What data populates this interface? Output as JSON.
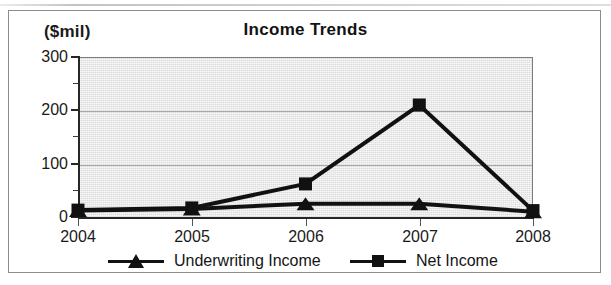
{
  "figure": {
    "unit_label": "($mil)",
    "title": "Income Trends"
  },
  "legend": {
    "entries": [
      {
        "label": "Underwriting Income",
        "marker": "triangle-marker",
        "color": "#111111"
      },
      {
        "label": "Net Income",
        "marker": "square-marker",
        "color": "#111111"
      }
    ]
  },
  "axes": {
    "y_ticks": [
      "0",
      "100",
      "200",
      "300"
    ],
    "x_ticks": [
      "2004",
      "2005",
      "2006",
      "2007",
      "2008"
    ]
  },
  "colors": {
    "plot_background": "#dcdcdc",
    "gridline": "#a8a8a8",
    "axis": "#262626",
    "series": "#111111",
    "frame": "#8d8d8d"
  },
  "chart_data": {
    "type": "line",
    "title": "Income Trends",
    "xlabel": "",
    "ylabel": "($mil)",
    "ylim": [
      0,
      300
    ],
    "yticks": [
      0,
      100,
      200,
      300
    ],
    "y_minor_ticks": [
      50,
      150,
      250
    ],
    "grid": "horizontal",
    "legend_position": "bottom",
    "categories": [
      "2004",
      "2005",
      "2006",
      "2007",
      "2008"
    ],
    "series": [
      {
        "name": "Underwriting Income",
        "marker": "triangle",
        "values": [
          12,
          15,
          25,
          25,
          10
        ]
      },
      {
        "name": "Net Income",
        "marker": "square",
        "values": [
          13,
          17,
          62,
          210,
          12
        ]
      }
    ]
  }
}
